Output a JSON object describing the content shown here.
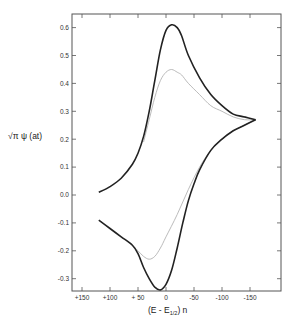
{
  "chart_data": {
    "type": "line",
    "title": "",
    "xlabel": "(E - E1/2) n",
    "ylabel": "√π ψ (at)",
    "xlim": [
      150,
      -200
    ],
    "ylim": [
      -0.35,
      0.65
    ],
    "x_ticks": [
      150,
      100,
      50,
      0,
      -50,
      -100,
      -150
    ],
    "x_tick_labels": [
      "+150",
      "+100",
      "+ 50",
      "0",
      "-50",
      "-100",
      "-150"
    ],
    "y_ticks": [
      0.6,
      0.5,
      0.4,
      0.3,
      0.2,
      0.1,
      0.0,
      -0.1,
      -0.2,
      -0.3
    ],
    "y_tick_labels": [
      "0.6",
      "0.5",
      "0.4",
      "0.3",
      "0.2",
      "0.1",
      "0.0",
      "-0.1",
      "-0.2",
      "-0.3"
    ],
    "grid": false,
    "legend": null,
    "series": [
      {
        "name": "forward-sweep-bold",
        "style": "solid-bold",
        "color": "#222222",
        "x": [
          120,
          100,
          80,
          60,
          50,
          40,
          30,
          20,
          10,
          0,
          -10,
          -20,
          -28,
          -40,
          -60,
          -80,
          -100,
          -120,
          -140,
          -160
        ],
        "y": [
          0.01,
          0.03,
          0.06,
          0.11,
          0.15,
          0.21,
          0.3,
          0.41,
          0.52,
          0.59,
          0.61,
          0.6,
          0.57,
          0.5,
          0.42,
          0.36,
          0.32,
          0.29,
          0.28,
          0.27
        ]
      },
      {
        "name": "reverse-sweep-bold",
        "style": "solid-bold",
        "color": "#222222",
        "x": [
          -160,
          -140,
          -120,
          -100,
          -80,
          -60,
          -50,
          -40,
          -30,
          -20,
          -10,
          0,
          10,
          20,
          30,
          40,
          50,
          60,
          80,
          100,
          120
        ],
        "y": [
          0.27,
          0.25,
          0.23,
          0.2,
          0.16,
          0.09,
          0.04,
          -0.02,
          -0.1,
          -0.19,
          -0.27,
          -0.32,
          -0.34,
          -0.33,
          -0.3,
          -0.26,
          -0.21,
          -0.18,
          -0.15,
          -0.12,
          -0.09
        ]
      },
      {
        "name": "forward-sweep-thin",
        "style": "thin-gray",
        "color": "#aaaaaa",
        "x": [
          40,
          30,
          20,
          10,
          0,
          -10,
          -20,
          -28,
          -40,
          -60,
          -80,
          -100,
          -120,
          -140,
          -160
        ],
        "y": [
          0.19,
          0.27,
          0.35,
          0.41,
          0.44,
          0.45,
          0.44,
          0.43,
          0.4,
          0.36,
          0.32,
          0.3,
          0.28,
          0.27,
          0.27
        ]
      },
      {
        "name": "reverse-sweep-thin",
        "style": "thin-gray",
        "color": "#aaaaaa",
        "x": [
          -160,
          -140,
          -120,
          -100,
          -80,
          -60,
          -40,
          -20,
          0,
          10,
          20,
          30,
          40,
          50,
          60
        ],
        "y": [
          0.27,
          0.25,
          0.23,
          0.2,
          0.16,
          0.1,
          0.02,
          -0.07,
          -0.15,
          -0.19,
          -0.22,
          -0.23,
          -0.22,
          -0.2,
          -0.18
        ]
      }
    ]
  },
  "axes": {
    "x_title_main": "(E - E",
    "x_title_sub": "1/2",
    "x_title_end": ") n",
    "y_title": "√π  ψ (at)"
  }
}
